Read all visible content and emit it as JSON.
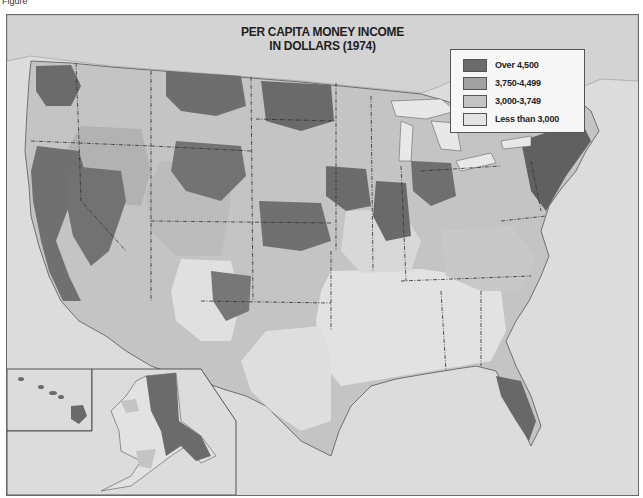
{
  "figure": {
    "label": "Figure"
  },
  "map": {
    "title_line1": "PER CAPITA MONEY INCOME",
    "title_line2": "IN DOLLARS (1974)",
    "region": "United States (contiguous, with Alaska and Hawaii insets)",
    "colors": {
      "ocean": "#dcdcdc",
      "land_background": "#e2e2e2",
      "lakes": "#e8e8e8",
      "canada": "#d6d6d6",
      "border": "#3a3a3a"
    }
  },
  "legend": {
    "items": [
      {
        "label": "Over 4,500",
        "color": "#6b6b6b"
      },
      {
        "label": "3,750-4,499",
        "color": "#a2a2a2"
      },
      {
        "label": "3,000-3,749",
        "color": "#c4c4c4"
      },
      {
        "label": "Less than 3,000",
        "color": "#e4e4e4"
      }
    ]
  },
  "insets": [
    {
      "name": "Hawaii"
    },
    {
      "name": "Alaska"
    }
  ]
}
